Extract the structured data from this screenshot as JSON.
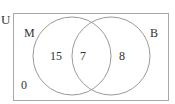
{
  "diagram": {
    "type": "venn",
    "universe_label": "U",
    "sets": [
      {
        "label": "M",
        "only_count": "15"
      },
      {
        "label": "B",
        "only_count": "8"
      }
    ],
    "intersection_count": "7",
    "outside_count": "0",
    "colors": {
      "stroke": "#9a9a9a",
      "text": "#333333",
      "background": "#ffffff"
    }
  }
}
